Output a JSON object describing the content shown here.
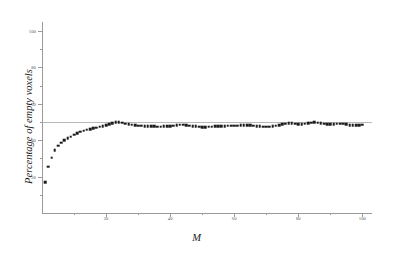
{
  "chart_data": {
    "type": "scatter",
    "title": "",
    "xlabel": "M",
    "ylabel": "Percentage of empty voxels",
    "xlim": [
      0,
      103
    ],
    "ylim": [
      0,
      105
    ],
    "grid": false,
    "legend": null,
    "xticks": [
      20,
      40,
      60,
      80,
      100
    ],
    "yticks": [
      20,
      40,
      60,
      80,
      100
    ],
    "xminor": [
      10,
      30,
      50,
      70,
      90
    ],
    "yminor": [
      10,
      30,
      50,
      70,
      90
    ],
    "marker": "square",
    "marker_color": "#1b1b1b",
    "reference_line": {
      "y": 50,
      "color": "#b9b9b9",
      "orientation": "horizontal"
    },
    "x": [
      1,
      2,
      3,
      4,
      5,
      6,
      7,
      8,
      9,
      10,
      11,
      12,
      13,
      14,
      15,
      16,
      17,
      18,
      19,
      20,
      21,
      22,
      23,
      24,
      25,
      26,
      27,
      28,
      29,
      30,
      31,
      32,
      33,
      34,
      35,
      36,
      37,
      38,
      39,
      40,
      41,
      42,
      43,
      44,
      45,
      46,
      47,
      48,
      49,
      50,
      51,
      52,
      53,
      54,
      55,
      56,
      57,
      58,
      59,
      60,
      61,
      62,
      63,
      64,
      65,
      66,
      67,
      68,
      69,
      70,
      71,
      72,
      73,
      74,
      75,
      76,
      77,
      78,
      79,
      80,
      81,
      82,
      83,
      84,
      85,
      86,
      87,
      88,
      89,
      90,
      91,
      92,
      93,
      94,
      95,
      96,
      97,
      98,
      99,
      100
    ],
    "values": [
      17.0,
      25.5,
      30.5,
      34.5,
      37.0,
      38.6,
      40.0,
      41.0,
      42.0,
      43.0,
      43.8,
      44.6,
      45.2,
      45.7,
      46.2,
      46.6,
      47.0,
      47.4,
      47.8,
      48.4,
      48.9,
      49.4,
      49.8,
      50.0,
      49.7,
      49.2,
      48.8,
      48.5,
      48.3,
      48.1,
      47.9,
      47.8,
      47.7,
      47.6,
      47.6,
      47.5,
      47.5,
      47.6,
      47.7,
      47.8,
      48.1,
      48.4,
      48.6,
      48.6,
      48.4,
      48.1,
      47.8,
      47.6,
      47.4,
      47.3,
      47.3,
      47.4,
      47.5,
      47.6,
      47.7,
      47.8,
      47.8,
      47.9,
      47.9,
      48.0,
      48.1,
      48.2,
      48.3,
      48.3,
      48.2,
      48.0,
      47.8,
      47.6,
      47.5,
      47.4,
      47.5,
      47.7,
      48.0,
      48.4,
      48.8,
      49.1,
      49.3,
      49.3,
      49.1,
      48.8,
      48.9,
      49.2,
      49.5,
      49.7,
      49.8,
      49.6,
      49.3,
      49.0,
      48.8,
      48.7,
      48.8,
      49.0,
      49.1,
      49.0,
      48.7,
      48.4,
      48.2,
      48.2,
      48.4,
      48.6
    ]
  }
}
